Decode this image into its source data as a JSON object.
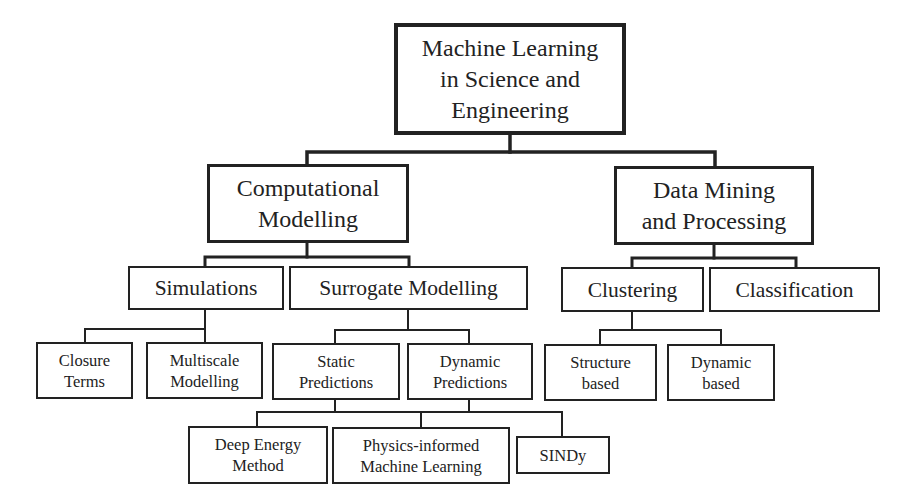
{
  "diagram": {
    "type": "tree",
    "title": "Machine Learning in Science and Engineering",
    "nodes": [
      {
        "id": "root",
        "label": "Machine Learning\nin Science and\nEngineering",
        "level": 0,
        "x": 394,
        "y": 23,
        "w": 232,
        "h": 112
      },
      {
        "id": "computational-modelling",
        "label": "Computational\nModelling",
        "level": 1,
        "parent": "root",
        "x": 207,
        "y": 164,
        "w": 202,
        "h": 79
      },
      {
        "id": "data-mining",
        "label": "Data Mining\nand Processing",
        "level": 1,
        "parent": "root",
        "x": 614,
        "y": 166,
        "w": 200,
        "h": 79
      },
      {
        "id": "simulations",
        "label": "Simulations",
        "level": 2,
        "parent": "computational-modelling",
        "x": 128,
        "y": 266,
        "w": 156,
        "h": 44
      },
      {
        "id": "surrogate-modelling",
        "label": "Surrogate Modelling",
        "level": 2,
        "parent": "computational-modelling",
        "x": 289,
        "y": 266,
        "w": 239,
        "h": 44
      },
      {
        "id": "clustering",
        "label": "Clustering",
        "level": 2,
        "parent": "data-mining",
        "x": 561,
        "y": 267,
        "w": 143,
        "h": 45
      },
      {
        "id": "classification",
        "label": "Classification",
        "level": 2,
        "parent": "data-mining",
        "x": 709,
        "y": 267,
        "w": 171,
        "h": 45
      },
      {
        "id": "closure-terms",
        "label": "Closure\nTerms",
        "level": 3,
        "parent": "simulations",
        "x": 36,
        "y": 342,
        "w": 97,
        "h": 57
      },
      {
        "id": "multiscale-modelling",
        "label": "Multiscale\nModelling",
        "level": 3,
        "parent": "simulations",
        "x": 146,
        "y": 342,
        "w": 117,
        "h": 57
      },
      {
        "id": "static-predictions",
        "label": "Static\nPredictions",
        "level": 3,
        "parent": "surrogate-modelling",
        "x": 272,
        "y": 343,
        "w": 128,
        "h": 57
      },
      {
        "id": "dynamic-predictions",
        "label": "Dynamic\nPredictions",
        "level": 3,
        "parent": "surrogate-modelling",
        "x": 407,
        "y": 343,
        "w": 126,
        "h": 57
      },
      {
        "id": "structure-based",
        "label": "Structure\nbased",
        "level": 3,
        "parent": "clustering",
        "x": 544,
        "y": 344,
        "w": 113,
        "h": 57
      },
      {
        "id": "dynamic-based",
        "label": "Dynamic\nbased",
        "level": 3,
        "parent": "clustering",
        "x": 667,
        "y": 344,
        "w": 108,
        "h": 57
      },
      {
        "id": "deep-energy-method",
        "label": "Deep Energy\nMethod",
        "level": 4,
        "parent": [
          "static-predictions",
          "dynamic-predictions"
        ],
        "x": 188,
        "y": 426,
        "w": 140,
        "h": 58
      },
      {
        "id": "piml",
        "label": "Physics-informed\nMachine Learning",
        "level": 4,
        "parent": [
          "static-predictions",
          "dynamic-predictions"
        ],
        "x": 332,
        "y": 427,
        "w": 178,
        "h": 57
      },
      {
        "id": "sindy",
        "label": "SINDy",
        "level": 4,
        "parent": [
          "static-predictions",
          "dynamic-predictions"
        ],
        "x": 516,
        "y": 436,
        "w": 94,
        "h": 38
      }
    ],
    "connectors": [
      {
        "points": [
          [
            510,
            135
          ],
          [
            510,
            152
          ]
        ],
        "w": 3.5
      },
      {
        "points": [
          [
            307,
            164
          ],
          [
            307,
            152
          ],
          [
            715,
            152
          ],
          [
            715,
            166
          ]
        ],
        "w": 3.5
      },
      {
        "points": [
          [
            307,
            243
          ],
          [
            307,
            257
          ]
        ],
        "w": 3
      },
      {
        "points": [
          [
            205,
            266
          ],
          [
            205,
            257
          ],
          [
            409,
            257
          ],
          [
            409,
            266
          ]
        ],
        "w": 3
      },
      {
        "points": [
          [
            714,
            245
          ],
          [
            714,
            258
          ]
        ],
        "w": 3
      },
      {
        "points": [
          [
            632,
            267
          ],
          [
            632,
            258
          ],
          [
            796,
            258
          ],
          [
            796,
            267
          ]
        ],
        "w": 3
      },
      {
        "points": [
          [
            205,
            310
          ],
          [
            205,
            342
          ]
        ],
        "w": 2
      },
      {
        "points": [
          [
            85,
            342
          ],
          [
            85,
            329
          ],
          [
            205,
            329
          ]
        ],
        "w": 2
      },
      {
        "points": [
          [
            408,
            310
          ],
          [
            408,
            330
          ]
        ],
        "w": 2
      },
      {
        "points": [
          [
            335,
            343
          ],
          [
            335,
            330
          ],
          [
            469,
            330
          ],
          [
            469,
            343
          ]
        ],
        "w": 2
      },
      {
        "points": [
          [
            632,
            312
          ],
          [
            632,
            330
          ]
        ],
        "w": 2
      },
      {
        "points": [
          [
            600,
            344
          ],
          [
            600,
            330
          ],
          [
            721,
            330
          ],
          [
            721,
            344
          ]
        ],
        "w": 2
      },
      {
        "points": [
          [
            335,
            400
          ],
          [
            335,
            412
          ]
        ],
        "w": 2
      },
      {
        "points": [
          [
            469,
            400
          ],
          [
            469,
            412
          ]
        ],
        "w": 2
      },
      {
        "points": [
          [
            257,
            426
          ],
          [
            257,
            412
          ],
          [
            562,
            412
          ],
          [
            562,
            436
          ]
        ],
        "w": 2
      },
      {
        "points": [
          [
            421,
            412
          ],
          [
            421,
            427
          ]
        ],
        "w": 2
      }
    ]
  }
}
